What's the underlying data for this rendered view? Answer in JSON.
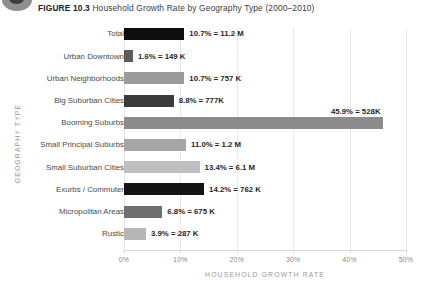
{
  "figure": {
    "number_label": "FIGURE 10.3",
    "caption": "Household Growth Rate by Geography Type (2000–2010)",
    "badge_icon": "figure-marker-icon"
  },
  "axes": {
    "x_title": "HOUSEHOLD GROWTH RATE",
    "y_title": "GEOGRAPHY TYPE",
    "x_ticks": [
      "0%",
      "10%",
      "20%",
      "30%",
      "40%",
      "50%"
    ]
  },
  "chart_data": {
    "type": "bar",
    "orientation": "horizontal",
    "title": "Household Growth Rate by Geography Type (2000–2010)",
    "xlabel": "HOUSEHOLD GROWTH RATE",
    "ylabel": "GEOGRAPHY TYPE",
    "xlim": [
      0,
      50
    ],
    "xticks": [
      0,
      10,
      20,
      30,
      40,
      50
    ],
    "xtick_labels": [
      "0%",
      "10%",
      "20%",
      "30%",
      "40%",
      "50%"
    ],
    "grid": true,
    "legend": "none",
    "categories": [
      "Total",
      "Urban Downtown",
      "Urban Neighborhoods",
      "Big Suburban Cities",
      "Booming Suburbs",
      "Small Principal Suburbs",
      "Small Suburban Cities",
      "Exurbs / Commuter",
      "Micropolitan Areas",
      "Rustic"
    ],
    "values": [
      10.7,
      1.6,
      10.7,
      8.8,
      45.9,
      11.0,
      13.4,
      14.2,
      6.8,
      3.9
    ],
    "data_labels": [
      "10.7% = 11.2 M",
      "1.6% = 149 K",
      "10.7% = 757 K",
      "8.8% = 777K",
      "45.9% = 528K",
      "11.0% = 1.2 M",
      "13.4% = 6.1 M",
      "14.2% = 762 K",
      "6.8% = 675 K",
      "3.9% = 287 K"
    ],
    "household_counts": [
      "11.2 M",
      "149 K",
      "757 K",
      "777K",
      "528K",
      "1.2 M",
      "6.1 M",
      "762 K",
      "675 K",
      "287 K"
    ],
    "bar_colors": [
      "#0d0d0d",
      "#5c5c5c",
      "#9b9b9b",
      "#3b3b3b",
      "#8b8b8b",
      "#a6a6a6",
      "#bfbfbf",
      "#141414",
      "#6f6f6f",
      "#b6b6b6"
    ],
    "label_positions": [
      "right",
      "right",
      "right",
      "right",
      "above-right",
      "right",
      "right",
      "right",
      "right",
      "right"
    ]
  }
}
